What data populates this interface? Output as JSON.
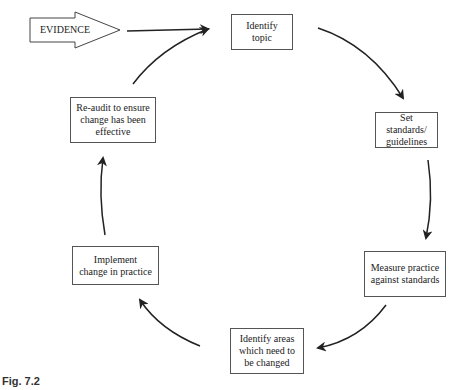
{
  "diagram": {
    "input": {
      "label": "EVIDENCE"
    },
    "steps": [
      {
        "label": "Identify topic"
      },
      {
        "label": "Set standards/ guidelines"
      },
      {
        "label": "Measure practice against standards"
      },
      {
        "label": "Identify areas which need to be changed"
      },
      {
        "label": "Implement change in practice"
      },
      {
        "label": "Re-audit to ensure change has been effective"
      }
    ],
    "caption": "Fig. 7.2",
    "colors": {
      "stroke": "#222222",
      "box_border": "#555555"
    }
  }
}
